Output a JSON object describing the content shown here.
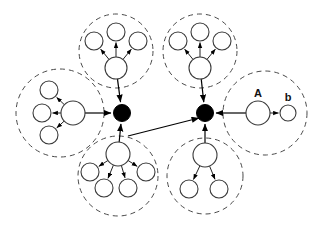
{
  "figure": {
    "name": "hierarchical-cluster-hub-diagram",
    "width": 316,
    "height": 227,
    "background_color": "#ffffff",
    "stroke_color": "#000000",
    "cluster_boundary_color": "#4a4a4a",
    "hub_fill_color": "#000000",
    "node_fill_color": "#ffffff"
  },
  "labels": {
    "node_a": "A",
    "node_b": "b"
  },
  "hubs": [
    {
      "id": "hub-left",
      "cx": 122,
      "cy": 113,
      "r": 8.5
    },
    {
      "id": "hub-right",
      "cx": 205,
      "cy": 113,
      "r": 8.5
    }
  ],
  "hub_link": {
    "from": "hub-left",
    "to": "hub-right",
    "x1": 128,
    "y1": 136,
    "x2": 199,
    "y2": 118,
    "arrow_at": "hub-right"
  },
  "clusters": [
    {
      "id": "cluster-top-left",
      "boundary": {
        "cx": 116,
        "cy": 51,
        "r": 37
      },
      "parent": {
        "cx": 116,
        "cy": 68,
        "r": 11
      },
      "children": [
        {
          "cx": 116,
          "cy": 32,
          "r": 9,
          "direction": "up"
        },
        {
          "cx": 94,
          "cy": 41,
          "r": 9,
          "direction": "up-left"
        },
        {
          "cx": 138,
          "cy": 41,
          "r": 9,
          "direction": "up-right"
        }
      ],
      "hub_connection": {
        "hub": "hub-left",
        "arrow_at": "hub"
      }
    },
    {
      "id": "cluster-top-right",
      "boundary": {
        "cx": 200,
        "cy": 51,
        "r": 37
      },
      "parent": {
        "cx": 200,
        "cy": 68,
        "r": 11
      },
      "children": [
        {
          "cx": 200,
          "cy": 32,
          "r": 9,
          "direction": "up"
        },
        {
          "cx": 178,
          "cy": 41,
          "r": 9,
          "direction": "up-left"
        },
        {
          "cx": 222,
          "cy": 41,
          "r": 9,
          "direction": "up-right"
        }
      ],
      "hub_connection": {
        "hub": "hub-right",
        "arrow_at": "hub"
      }
    },
    {
      "id": "cluster-left",
      "boundary": {
        "cx": 60,
        "cy": 113,
        "r": 44
      },
      "parent": {
        "cx": 73,
        "cy": 113,
        "r": 12
      },
      "children": [
        {
          "cx": 49,
          "cy": 90,
          "r": 9,
          "direction": "up-left"
        },
        {
          "cx": 42,
          "cy": 113,
          "r": 9,
          "direction": "left"
        },
        {
          "cx": 49,
          "cy": 135,
          "r": 9,
          "direction": "down-left"
        }
      ],
      "hub_connection": {
        "hub": "hub-left",
        "arrow_at": "hub"
      }
    },
    {
      "id": "cluster-right",
      "boundary": {
        "cx": 265,
        "cy": 113,
        "r": 42
      },
      "parent": {
        "cx": 258,
        "cy": 113,
        "r": 12,
        "label": "A"
      },
      "children": [
        {
          "cx": 288,
          "cy": 113,
          "r": 8,
          "direction": "right",
          "label": "b"
        }
      ],
      "hub_connection": {
        "hub": "hub-right",
        "arrow_at": "hub"
      }
    },
    {
      "id": "cluster-bottom-left",
      "boundary": {
        "cx": 118,
        "cy": 176,
        "r": 40
      },
      "parent": {
        "cx": 118,
        "cy": 154,
        "r": 12
      },
      "children": [
        {
          "cx": 90,
          "cy": 172,
          "r": 9,
          "direction": "down-far-left"
        },
        {
          "cx": 104,
          "cy": 188,
          "r": 9,
          "direction": "down-left"
        },
        {
          "cx": 128,
          "cy": 188,
          "r": 9,
          "direction": "down-right"
        },
        {
          "cx": 146,
          "cy": 172,
          "r": 9,
          "direction": "down-far-right"
        }
      ],
      "hub_connection": {
        "hub": "hub-left",
        "arrow_at": "hub"
      }
    },
    {
      "id": "cluster-bottom-right",
      "boundary": {
        "cx": 205,
        "cy": 176,
        "r": 38
      },
      "parent": {
        "cx": 205,
        "cy": 155,
        "r": 12
      },
      "children": [
        {
          "cx": 189,
          "cy": 189,
          "r": 9,
          "direction": "down-left"
        },
        {
          "cx": 219,
          "cy": 189,
          "r": 9,
          "direction": "down-right"
        }
      ],
      "hub_connection": {
        "hub": "hub-right",
        "arrow_at": "hub"
      }
    }
  ]
}
